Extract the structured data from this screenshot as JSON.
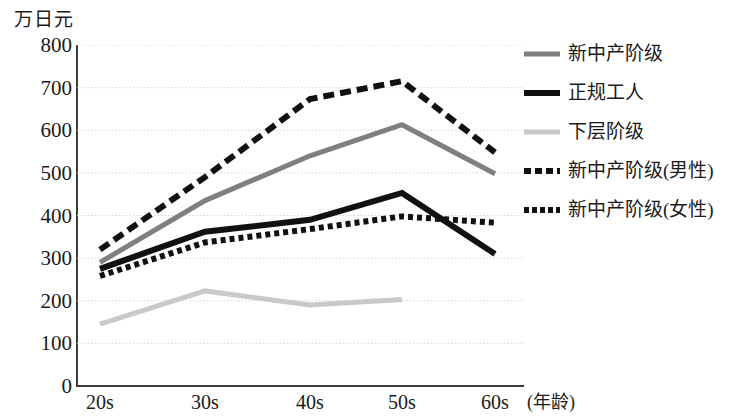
{
  "chart_data": {
    "type": "line",
    "title": "",
    "subtitle": "",
    "xlabel": "(年龄)",
    "ylabel": "万日元",
    "categories": [
      "20s",
      "30s",
      "40s",
      "50s",
      "60s"
    ],
    "ylim": [
      0,
      800
    ],
    "ytick_labels": [
      "0",
      "100",
      "200",
      "300",
      "400",
      "500",
      "600",
      "700",
      "800"
    ],
    "ytick_values": [
      0,
      100,
      200,
      300,
      400,
      500,
      600,
      700,
      800
    ],
    "grid": "horizontal-dotted",
    "legend_position": "right",
    "series": [
      {
        "name": "新中产阶级",
        "style": "solid",
        "color": "#7f7f7f",
        "width": 5,
        "values": [
          290,
          435,
          540,
          613,
          498
        ]
      },
      {
        "name": "正规工人",
        "style": "solid",
        "color": "#111111",
        "width": 6,
        "values": [
          275,
          362,
          390,
          453,
          310
        ]
      },
      {
        "name": "下层阶级",
        "style": "solid",
        "color": "#c9c9c9",
        "width": 5,
        "values": [
          145,
          223,
          190,
          203,
          null
        ]
      },
      {
        "name": "新中产阶级(男性)",
        "style": "dashed",
        "color": "#111111",
        "width": 6,
        "values": [
          320,
          490,
          673,
          715,
          548
        ]
      },
      {
        "name": "新中产阶级(女性)",
        "style": "dotted",
        "color": "#111111",
        "width": 6,
        "values": [
          258,
          337,
          368,
          398,
          383
        ]
      }
    ]
  },
  "axis": {
    "unit_caption": "万日元",
    "x_caption": "(年龄)"
  },
  "legend": {
    "items": [
      {
        "label": "新中产阶级"
      },
      {
        "label": "正规工人"
      },
      {
        "label": "下层阶级"
      },
      {
        "label": "新中产阶级(男性)"
      },
      {
        "label": "新中产阶级(女性)"
      }
    ]
  }
}
